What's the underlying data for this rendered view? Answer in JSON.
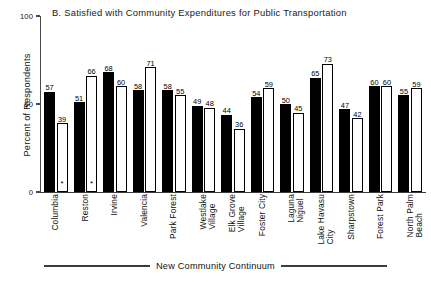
{
  "chart_data": {
    "type": "bar",
    "title": "B.  Satisfied with Community Expenditures for Public Transportation",
    "xlabel": "New Community Continuum",
    "ylabel": "Percent of Respondents",
    "ylim": [
      0,
      100
    ],
    "yticks": [
      0,
      50,
      100
    ],
    "ytick_labels": [
      "0",
      "50",
      "100"
    ],
    "grid": false,
    "legend": "none",
    "categories": [
      "Columbia",
      "Reston",
      "Irvine",
      "Valencia",
      "Park Forest",
      "Westlake\nVillage",
      "Elk Grove\nVillage",
      "Foster City",
      "Laguna\nNiguel",
      "Lake Havasu\nCity",
      "Sharpstown",
      "Forest Park",
      "North Palm\nBeach"
    ],
    "series": [
      {
        "name": "black",
        "fill": "#000000",
        "values": [
          57,
          51,
          68,
          58,
          58,
          49,
          44,
          54,
          50,
          65,
          47,
          60,
          55
        ],
        "markers": [
          "",
          "",
          "",
          "",
          "",
          "",
          "",
          "",
          "",
          "",
          "",
          "",
          ""
        ]
      },
      {
        "name": "white",
        "fill": "#ffffff",
        "values": [
          39,
          66,
          60,
          71,
          55,
          48,
          36,
          59,
          45,
          73,
          42,
          60,
          59
        ],
        "markers": [
          "*",
          "*",
          "",
          "",
          "",
          "",
          "",
          "",
          "",
          "",
          "",
          "",
          ""
        ]
      }
    ],
    "annotations": [
      "*"
    ]
  }
}
